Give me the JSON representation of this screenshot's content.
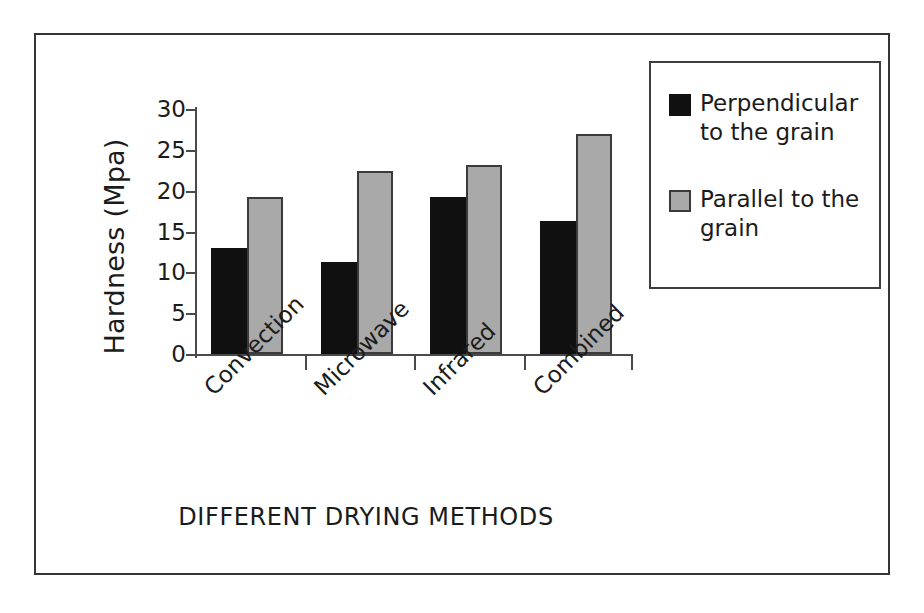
{
  "chart_data": {
    "type": "bar",
    "title": "",
    "xlabel": "DIFFERENT DRYING METHODS",
    "ylabel": "Hardness (Mpa)",
    "categories": [
      "Convection",
      "Microwave",
      "Infrared",
      "Combined"
    ],
    "series": [
      {
        "name": "Perpendicular to the grain",
        "values": [
          13.0,
          11.3,
          19.2,
          16.3
        ],
        "color": "#101010"
      },
      {
        "name": "Parallel to  the grain",
        "values": [
          19.2,
          22.4,
          23.2,
          26.9
        ],
        "color": "#a9a9a9"
      }
    ],
    "ylim": [
      0,
      30
    ],
    "yticks": [
      0,
      5,
      10,
      15,
      20,
      25,
      30
    ],
    "ytick_labels": [
      "0",
      "5",
      "10",
      "15",
      "20",
      "25",
      "30"
    ],
    "grid": false,
    "legend_position": "upper right",
    "legend_entries": [
      "Perpendicular\nto the grain",
      "Parallel to  the\ngrain"
    ]
  },
  "axes": {
    "y_title": "Hardness (Mpa)",
    "x_title": "DIFFERENT DRYING METHODS"
  }
}
